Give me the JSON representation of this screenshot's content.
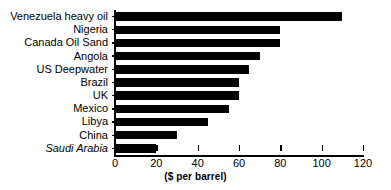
{
  "chart_data": {
    "type": "bar",
    "orientation": "horizontal",
    "title": "",
    "xlabel": "($ per barrel)",
    "ylabel": "",
    "xlim": [
      0,
      120
    ],
    "xticks": [
      0,
      20,
      40,
      60,
      80,
      100,
      120
    ],
    "xtick_labels": [
      "0",
      "20",
      "40",
      "60",
      "80",
      "100",
      "120"
    ],
    "grid": false,
    "legend": false,
    "bar_color": "#000000",
    "categories": [
      "Venezuela heavy oil",
      "Nigeria",
      "Canada Oil Sand",
      "Angola",
      "US Deepwater",
      "Brazil",
      "UK",
      "Mexico",
      "Libya",
      "China",
      "Saudi Arabia"
    ],
    "values": [
      110,
      80,
      80,
      70,
      65,
      60,
      60,
      55,
      45,
      30,
      20
    ],
    "category_styles": [
      "normal",
      "normal",
      "normal",
      "normal",
      "normal",
      "normal",
      "normal",
      "normal",
      "normal",
      "normal",
      "italic"
    ],
    "bars": [
      {
        "label": "Venezuela heavy oil",
        "value": 110,
        "style": "normal"
      },
      {
        "label": "Nigeria",
        "value": 80,
        "style": "normal"
      },
      {
        "label": "Canada Oil Sand",
        "value": 80,
        "style": "normal"
      },
      {
        "label": "Angola",
        "value": 70,
        "style": "normal"
      },
      {
        "label": "US Deepwater",
        "value": 65,
        "style": "normal"
      },
      {
        "label": "Brazil",
        "value": 60,
        "style": "normal"
      },
      {
        "label": "UK",
        "value": 60,
        "style": "normal"
      },
      {
        "label": "Mexico",
        "value": 55,
        "style": "normal"
      },
      {
        "label": "Libya",
        "value": 45,
        "style": "normal"
      },
      {
        "label": "China",
        "value": 30,
        "style": "normal"
      },
      {
        "label": "Saudi Arabia",
        "value": 20,
        "style": "italic"
      }
    ]
  }
}
